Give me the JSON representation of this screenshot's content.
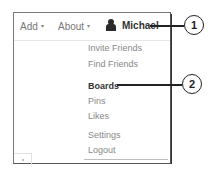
{
  "navbar": {
    "add_label": "Add",
    "about_label": "About",
    "user_name": "Michael",
    "caret_glyph": "▾",
    "avatar_icon": "user-silhouette-icon"
  },
  "menu": {
    "items": [
      {
        "label": "Invite Friends",
        "active": false
      },
      {
        "label": "Find Friends",
        "active": false
      },
      {
        "label": "Boards",
        "active": true
      },
      {
        "label": "Pins",
        "active": false
      },
      {
        "label": "Likes",
        "active": false
      },
      {
        "label": "Settings",
        "active": false
      },
      {
        "label": "Logout",
        "active": false
      }
    ]
  },
  "callouts": [
    {
      "number": "1",
      "target": "Michael"
    },
    {
      "number": "2",
      "target": "Boards"
    }
  ],
  "colors": {
    "text_muted": "#888888",
    "text_active": "#333333",
    "callout_line": "#222222"
  }
}
